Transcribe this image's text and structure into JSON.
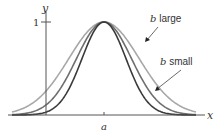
{
  "chart_data": {
    "type": "line",
    "title": "",
    "xlabel": "x",
    "ylabel": "y",
    "x_tick_labels": [
      "a"
    ],
    "y_tick_labels": [
      "1"
    ],
    "center": "a",
    "peak_value": 1,
    "grid": false,
    "series": [
      {
        "name": "b large",
        "relative_width": 1.6,
        "color": "#a8a8a8"
      },
      {
        "name": "b medium",
        "relative_width": 1.25,
        "color": "#6e6e6e"
      },
      {
        "name": "b small",
        "relative_width": 1.0,
        "color": "#3a3a3a"
      }
    ],
    "annotations": [
      {
        "prefix": "b",
        "text": " large",
        "target_series": "b large"
      },
      {
        "prefix": "b",
        "text": " small",
        "target_series": "b small"
      }
    ]
  }
}
